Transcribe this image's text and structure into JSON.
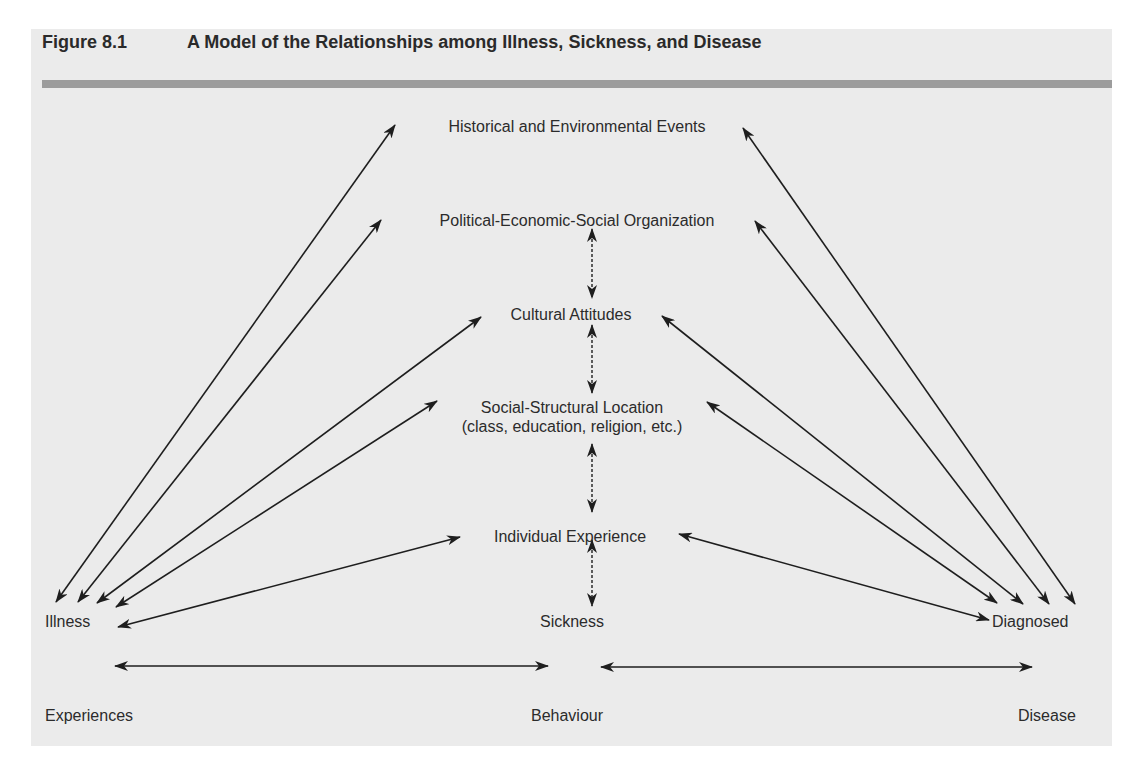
{
  "figure": {
    "number": "Figure 8.1",
    "title": "A Model of the Relationships among Illness, Sickness, and Disease"
  },
  "nodes": {
    "historical": "Historical and Environmental Events",
    "political": "Political-Economic-Social Organization",
    "cultural": "Cultural Attitudes",
    "social_line1": "Social-Structural Location",
    "social_line2": "(class, education, religion, etc.)",
    "individual": "Individual Experience",
    "illness": "Illness",
    "sickness": "Sickness",
    "diagnosed": "Diagnosed"
  },
  "bottom_labels": {
    "experiences": "Experiences",
    "behaviour": "Behaviour",
    "disease": "Disease"
  },
  "colors": {
    "panel_background": "#ebebeb",
    "title_bar": "#9c9c9c",
    "text": "#2b2b2b",
    "arrow": "#1e1e1e"
  },
  "edges": [
    {
      "from": "illness",
      "to": "historical",
      "style": "solid",
      "bidirectional": true
    },
    {
      "from": "illness",
      "to": "political",
      "style": "solid",
      "bidirectional": true
    },
    {
      "from": "illness",
      "to": "cultural",
      "style": "solid",
      "bidirectional": true
    },
    {
      "from": "illness",
      "to": "social",
      "style": "solid",
      "bidirectional": true
    },
    {
      "from": "illness",
      "to": "individual",
      "style": "solid",
      "bidirectional": true
    },
    {
      "from": "diagnosed",
      "to": "historical",
      "style": "solid",
      "bidirectional": true
    },
    {
      "from": "diagnosed",
      "to": "political",
      "style": "solid",
      "bidirectional": true
    },
    {
      "from": "diagnosed",
      "to": "cultural",
      "style": "solid",
      "bidirectional": true
    },
    {
      "from": "diagnosed",
      "to": "social",
      "style": "solid",
      "bidirectional": true
    },
    {
      "from": "diagnosed",
      "to": "individual",
      "style": "solid",
      "bidirectional": true
    },
    {
      "from": "political",
      "to": "cultural",
      "style": "dashed",
      "bidirectional": true
    },
    {
      "from": "cultural",
      "to": "social",
      "style": "dashed",
      "bidirectional": true
    },
    {
      "from": "social",
      "to": "individual",
      "style": "dashed",
      "bidirectional": true
    },
    {
      "from": "individual",
      "to": "sickness",
      "style": "dashed",
      "bidirectional": true
    },
    {
      "from": "experiences",
      "to": "behaviour",
      "style": "solid",
      "bidirectional": true
    },
    {
      "from": "behaviour",
      "to": "disease",
      "style": "solid",
      "bidirectional": true
    }
  ]
}
